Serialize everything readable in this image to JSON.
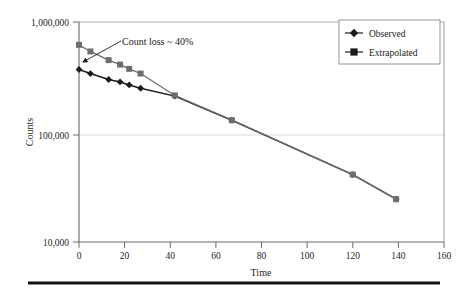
{
  "chart_data": {
    "type": "line",
    "title": "",
    "xlabel": "Time",
    "ylabel": "Counts",
    "xlim": [
      0,
      160
    ],
    "ylim": [
      10000,
      1000000
    ],
    "yscale": "log",
    "grid": "horizontal",
    "legend_position": "top-right",
    "x_ticks": [
      "0",
      "20",
      "40",
      "60",
      "80",
      "100",
      "120",
      "140",
      "160"
    ],
    "x_tick_values": [
      0,
      20,
      40,
      60,
      80,
      100,
      120,
      140,
      160
    ],
    "y_ticks": [
      "10,000",
      "100,000",
      "1,000,000"
    ],
    "y_tick_values": [
      10000,
      100000,
      1000000
    ],
    "series": [
      {
        "name": "Observed",
        "marker": "diamond",
        "color": "#1a1a1a",
        "points": [
          {
            "x": 0,
            "y": 370000
          },
          {
            "x": 5,
            "y": 340000
          },
          {
            "x": 13,
            "y": 300000
          },
          {
            "x": 18,
            "y": 285000
          },
          {
            "x": 22,
            "y": 268000
          },
          {
            "x": 27,
            "y": 250000
          },
          {
            "x": 42,
            "y": 212000
          },
          {
            "x": 67,
            "y": 128000
          },
          {
            "x": 120,
            "y": 41000
          },
          {
            "x": 139,
            "y": 24500
          }
        ]
      },
      {
        "name": "Extrapolated",
        "marker": "square",
        "color": "#6e6e6e",
        "points": [
          {
            "x": 0,
            "y": 620000
          },
          {
            "x": 5,
            "y": 540000
          },
          {
            "x": 13,
            "y": 450000
          },
          {
            "x": 18,
            "y": 410000
          },
          {
            "x": 22,
            "y": 375000
          },
          {
            "x": 27,
            "y": 340000
          },
          {
            "x": 42,
            "y": 215000
          },
          {
            "x": 67,
            "y": 128000
          },
          {
            "x": 120,
            "y": 41000
          },
          {
            "x": 139,
            "y": 24500
          }
        ]
      }
    ],
    "annotations": [
      {
        "text": "Count loss ~ 40%",
        "text_x": 122,
        "text_y": 45,
        "arrow_from_x": 121,
        "arrow_from_y": 41,
        "arrow_to_x": 83,
        "arrow_to_y": 62
      }
    ]
  },
  "legend": {
    "entries": [
      {
        "label": "Observed"
      },
      {
        "label": "Extrapolated"
      }
    ]
  },
  "footer": {
    "rule": ""
  }
}
